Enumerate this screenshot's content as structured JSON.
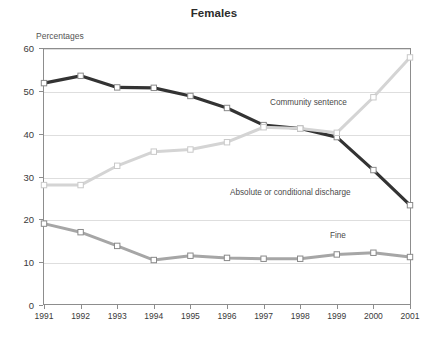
{
  "chart_data": {
    "type": "line",
    "title": "Females",
    "subtitle": "",
    "ylabel": "Percentages",
    "xlabel": "",
    "ylim": [
      0,
      60
    ],
    "yticks": [
      0,
      10,
      20,
      30,
      40,
      50,
      60
    ],
    "grid": true,
    "legend_position": "inline-annotations",
    "categories": [
      "1991",
      "1992",
      "1993",
      "1994",
      "1995",
      "1996",
      "1997",
      "1998",
      "1999",
      "2000",
      "2001"
    ],
    "series": [
      {
        "name": "Absolute or conditional discharge",
        "color": "#333333",
        "marker": "square-open",
        "values": [
          51.8,
          53.5,
          50.8,
          50.7,
          48.8,
          46.0,
          42.0,
          41.2,
          39.2,
          31.5,
          23.3
        ]
      },
      {
        "name": "Community sentence",
        "color": "#d4d4d4",
        "marker": "square-open",
        "values": [
          28.0,
          28.0,
          32.5,
          35.8,
          36.3,
          38.0,
          41.5,
          41.2,
          40.2,
          48.5,
          57.8
        ]
      },
      {
        "name": "Fine",
        "color": "#a6a6a6",
        "marker": "square-open",
        "values": [
          19.0,
          17.0,
          13.8,
          10.5,
          11.5,
          11.0,
          10.8,
          10.8,
          11.8,
          12.2,
          11.2
        ]
      }
    ],
    "annotations": [
      {
        "text": "Community sentence",
        "x_px": 270,
        "y_px": 98
      },
      {
        "text": "Absolute or conditional discharge",
        "x_px": 230,
        "y_px": 188
      },
      {
        "text": "Fine",
        "x_px": 330,
        "y_px": 231
      }
    ]
  }
}
